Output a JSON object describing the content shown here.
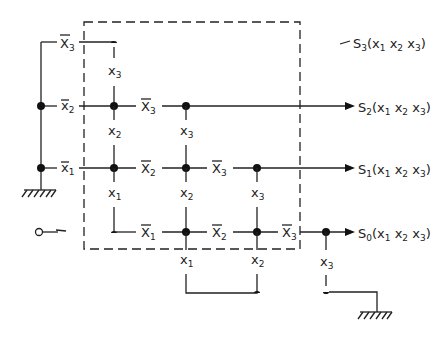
{
  "diagram": {
    "type": "relay contact tree / switching network",
    "boundary": "dashed rectangle enclosing the contact network",
    "inputs": {
      "row_contacts_left": [
        "x̄3",
        "x̄2",
        "x̄1"
      ],
      "source_symbol": "input terminal (circle with arrow)"
    },
    "contacts": [
      {
        "id": "nx3_top",
        "label": "X",
        "sub": "3",
        "bar": true
      },
      {
        "id": "x3_col1",
        "label": "x",
        "sub": "3",
        "bar": false
      },
      {
        "id": "nx2_left",
        "label": "x",
        "sub": "2",
        "bar": true
      },
      {
        "id": "x2_col1",
        "label": "x",
        "sub": "2",
        "bar": false
      },
      {
        "id": "nx3_row2",
        "label": "X",
        "sub": "3",
        "bar": true
      },
      {
        "id": "x3_col2",
        "label": "x",
        "sub": "3",
        "bar": false
      },
      {
        "id": "nx1_left",
        "label": "x",
        "sub": "1",
        "bar": true
      },
      {
        "id": "x1_col1",
        "label": "x",
        "sub": "1",
        "bar": false
      },
      {
        "id": "nx2_row3",
        "label": "X",
        "sub": "2",
        "bar": true
      },
      {
        "id": "x2_col2",
        "label": "x",
        "sub": "2",
        "bar": false
      },
      {
        "id": "nx3_row3",
        "label": "X",
        "sub": "3",
        "bar": true
      },
      {
        "id": "x3_col3",
        "label": "x",
        "sub": "3",
        "bar": false
      },
      {
        "id": "nx1_row4",
        "label": "X",
        "sub": "1",
        "bar": true
      },
      {
        "id": "nx2_row4",
        "label": "X",
        "sub": "2",
        "bar": true
      },
      {
        "id": "nx3_row4",
        "label": "X",
        "sub": "3",
        "bar": true
      },
      {
        "id": "x1_bottom",
        "label": "x",
        "sub": "1",
        "bar": false
      },
      {
        "id": "x2_bottom",
        "label": "x",
        "sub": "2",
        "bar": false
      },
      {
        "id": "x3_bottom",
        "label": "x",
        "sub": "3",
        "bar": false
      }
    ],
    "outputs": [
      {
        "name": "S",
        "sub": "3",
        "args": "(x",
        "a1": "1",
        "a2": "2",
        "a3": "3"
      },
      {
        "name": "S",
        "sub": "2",
        "args": "(x",
        "a1": "1",
        "a2": "2",
        "a3": "3"
      },
      {
        "name": "S",
        "sub": "1",
        "args": "(x",
        "a1": "1",
        "a2": "2",
        "a3": "3"
      },
      {
        "name": "S",
        "sub": "0",
        "args": "(x",
        "a1": "1",
        "a2": "2",
        "a3": "3"
      }
    ],
    "grounds": [
      "left ground below x̄1 bus",
      "right ground below x3 contact"
    ]
  }
}
